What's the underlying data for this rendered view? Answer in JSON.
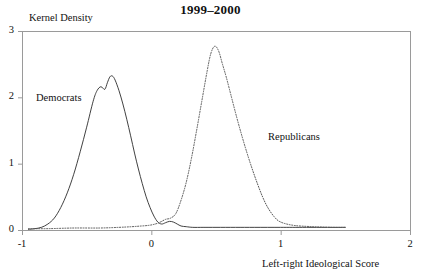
{
  "chart_data": {
    "type": "line",
    "title": "1999–2000",
    "xlabel": "Left-right Ideological Score",
    "ylabel": "Kernel Density",
    "xlim": [
      -1,
      2
    ],
    "ylim": [
      0,
      3
    ],
    "xticks": [
      "-1",
      "0",
      "1",
      "2"
    ],
    "xtick_values": [
      -1,
      0,
      1,
      2
    ],
    "yticks": [
      "0",
      "1",
      "2",
      "3"
    ],
    "ytick_values": [
      0,
      1,
      2,
      3
    ],
    "grid": false,
    "legend_position": "inline-annotations",
    "annotations": [
      {
        "text": "Democrats",
        "x": -0.62,
        "y": 2.08
      },
      {
        "text": "Republicans",
        "x": 0.91,
        "y": 1.35
      }
    ],
    "series": [
      {
        "name": "Democrats",
        "style": "solid",
        "color": "#2b2b2b",
        "peak_x": -0.33,
        "peak_y": 2.32,
        "x": [
          -0.95,
          -0.9,
          -0.85,
          -0.8,
          -0.75,
          -0.7,
          -0.65,
          -0.6,
          -0.55,
          -0.5,
          -0.45,
          -0.42,
          -0.39,
          -0.36,
          -0.34,
          -0.32,
          -0.3,
          -0.28,
          -0.25,
          -0.22,
          -0.19,
          -0.16,
          -0.13,
          -0.1,
          -0.07,
          -0.04,
          -0.01,
          0.02,
          0.05,
          0.08,
          0.11,
          0.14,
          0.17,
          0.2,
          0.23,
          0.27,
          0.32,
          0.4,
          0.5,
          0.65,
          0.8,
          1.0,
          1.2,
          1.5
        ],
        "y": [
          0.01,
          0.02,
          0.04,
          0.09,
          0.18,
          0.34,
          0.56,
          0.84,
          1.18,
          1.55,
          1.94,
          2.1,
          2.16,
          2.12,
          2.22,
          2.31,
          2.32,
          2.26,
          2.1,
          1.9,
          1.67,
          1.42,
          1.16,
          0.92,
          0.7,
          0.5,
          0.34,
          0.21,
          0.12,
          0.09,
          0.11,
          0.13,
          0.12,
          0.09,
          0.06,
          0.05,
          0.04,
          0.04,
          0.04,
          0.04,
          0.04,
          0.04,
          0.04,
          0.04
        ]
      },
      {
        "name": "Republicans",
        "style": "dotted",
        "color": "#555555",
        "peak_x": 0.49,
        "peak_y": 2.77,
        "x": [
          -0.95,
          -0.8,
          -0.6,
          -0.4,
          -0.25,
          -0.15,
          -0.08,
          -0.02,
          0.03,
          0.07,
          0.11,
          0.15,
          0.19,
          0.23,
          0.27,
          0.31,
          0.35,
          0.39,
          0.43,
          0.46,
          0.49,
          0.52,
          0.55,
          0.58,
          0.62,
          0.66,
          0.7,
          0.74,
          0.78,
          0.82,
          0.86,
          0.9,
          0.95,
          1.0,
          1.1,
          1.25,
          1.4,
          1.5
        ],
        "y": [
          0.02,
          0.02,
          0.03,
          0.03,
          0.04,
          0.05,
          0.06,
          0.07,
          0.09,
          0.12,
          0.16,
          0.18,
          0.25,
          0.45,
          0.72,
          1.08,
          1.5,
          1.94,
          2.38,
          2.66,
          2.77,
          2.7,
          2.5,
          2.3,
          2.0,
          1.7,
          1.42,
          1.16,
          0.92,
          0.7,
          0.5,
          0.34,
          0.2,
          0.12,
          0.07,
          0.05,
          0.04,
          0.04
        ]
      }
    ]
  },
  "axes": {
    "frame_color": "#9a9a9a"
  }
}
